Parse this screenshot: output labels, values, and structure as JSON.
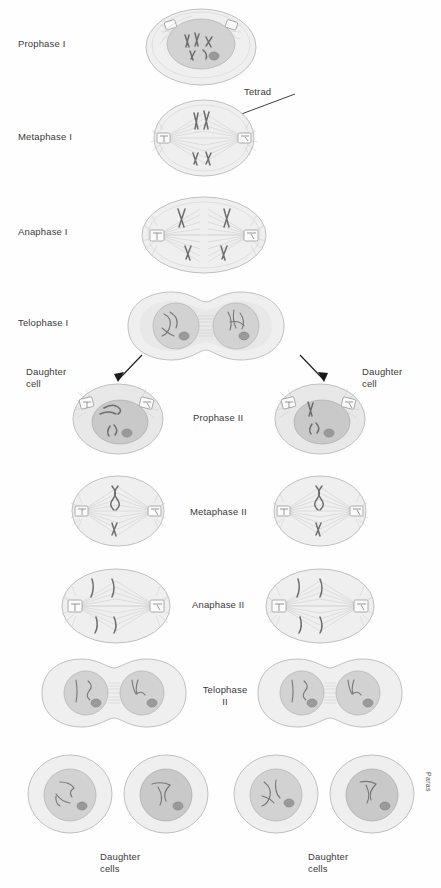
{
  "diagram": {
    "credit": "Paras",
    "background_color": "#fefefe",
    "text_color": "#3a3a3a"
  },
  "labels": {
    "prophase_1": "Prophase I",
    "metaphase_1": "Metaphase I",
    "anaphase_1": "Anaphase I",
    "telophase_1": "Telophase I",
    "tetrad": "Tetrad",
    "daughter_cell_left": "Daughter\ncell",
    "daughter_cell_right": "Daughter\ncell",
    "prophase_2": "Prophase II",
    "metaphase_2": "Metaphase II",
    "anaphase_2": "Anaphase II",
    "telophase_2": "Telophase\nII",
    "daughter_cells_left": "Daughter\ncells",
    "daughter_cells_right": "Daughter\ncells"
  },
  "stages": [
    {
      "id": "prophase-1",
      "label": "Prophase I",
      "cells": 1,
      "row": 1
    },
    {
      "id": "metaphase-1",
      "label": "Metaphase I",
      "cells": 1,
      "row": 2
    },
    {
      "id": "anaphase-1",
      "label": "Anaphase I",
      "cells": 1,
      "row": 3
    },
    {
      "id": "telophase-1",
      "label": "Telophase I",
      "cells": 1,
      "row": 4
    },
    {
      "id": "prophase-2",
      "label": "Prophase II",
      "cells": 2,
      "row": 5
    },
    {
      "id": "metaphase-2",
      "label": "Metaphase II",
      "cells": 2,
      "row": 6
    },
    {
      "id": "anaphase-2",
      "label": "Anaphase II",
      "cells": 2,
      "row": 7
    },
    {
      "id": "telophase-2",
      "label": "Telophase II",
      "cells": 2,
      "row": 8
    },
    {
      "id": "daughter-cells",
      "label": "Daughter cells",
      "cells": 4,
      "row": 9
    }
  ]
}
